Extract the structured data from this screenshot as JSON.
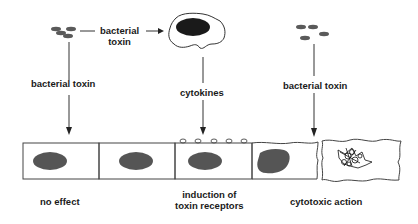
{
  "diagram": {
    "labels": {
      "toxin_to_macrophage": [
        "bacterial",
        "toxin"
      ],
      "left_toxin": "bacterial toxin",
      "cytokines": "cytokines",
      "right_toxin": "bacterial toxin",
      "no_effect": "no effect",
      "induction": [
        "induction of",
        "toxin receptors"
      ],
      "cytotoxic": "cytotoxic action"
    },
    "colors": {
      "line": "#333333",
      "nucleus": "#555555",
      "bacteria": "#5a5a5a",
      "macrophage_nucleus": "#1a1a1a"
    }
  }
}
